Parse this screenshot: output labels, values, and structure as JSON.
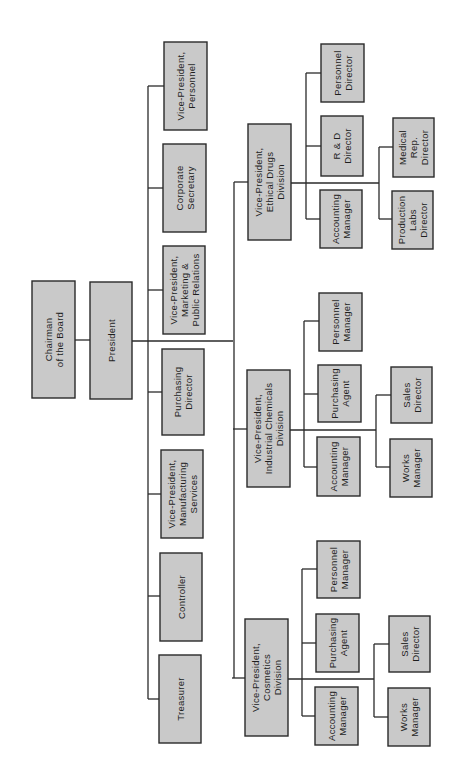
{
  "chart_data": {
    "type": "org-chart",
    "orientation": "rotated 90deg counter-clockwise",
    "root": {
      "id": "chairman",
      "label": [
        "Chairman",
        "of the Board"
      ],
      "children": [
        {
          "id": "president",
          "label": [
            "President"
          ],
          "children": [
            {
              "id": "vp-personnel",
              "label": [
                "Vice-President,",
                "Personnel"
              ]
            },
            {
              "id": "corporate-secretary",
              "label": [
                "Corporate",
                "Secretary"
              ]
            },
            {
              "id": "vp-marketing",
              "label": [
                "Vice-President,",
                "Marketing &",
                "Public Relations"
              ]
            },
            {
              "id": "purchasing-director",
              "label": [
                "Purchasing",
                "Director"
              ]
            },
            {
              "id": "vp-manufacturing",
              "label": [
                "Vice-President,",
                "Manufacturing",
                "Services"
              ]
            },
            {
              "id": "controller",
              "label": [
                "Controller"
              ]
            },
            {
              "id": "treasurer",
              "label": [
                "Treasurer"
              ]
            },
            {
              "id": "vp-ethical-drugs",
              "label": [
                "Vice-President,",
                "Ethical Drugs",
                "Division"
              ],
              "children": [
                {
                  "id": "ed-personnel-director",
                  "label": [
                    "Personnel",
                    "Director"
                  ]
                },
                {
                  "id": "ed-rd-director",
                  "label": [
                    "R & D",
                    "Director"
                  ]
                },
                {
                  "id": "ed-accounting-manager",
                  "label": [
                    "Accounting",
                    "Manager"
                  ]
                },
                {
                  "id": "ed-medical-rep-director",
                  "label": [
                    "Medical",
                    "Rep.",
                    "Director"
                  ]
                },
                {
                  "id": "ed-production-labs-director",
                  "label": [
                    "Production",
                    "Labs",
                    "Director"
                  ]
                }
              ]
            },
            {
              "id": "vp-industrial-chemicals",
              "label": [
                "Vice-President,",
                "Industrial Chemicals",
                "Division"
              ],
              "children": [
                {
                  "id": "ic-personnel-manager",
                  "label": [
                    "Personnel",
                    "Manager"
                  ]
                },
                {
                  "id": "ic-purchasing-agent",
                  "label": [
                    "Purchasing",
                    "Agent"
                  ]
                },
                {
                  "id": "ic-accounting-manager",
                  "label": [
                    "Accounting",
                    "Manager"
                  ]
                },
                {
                  "id": "ic-sales-director",
                  "label": [
                    "Sales",
                    "Director"
                  ]
                },
                {
                  "id": "ic-works-manager",
                  "label": [
                    "Works",
                    "Manager"
                  ]
                }
              ]
            },
            {
              "id": "vp-cosmetics",
              "label": [
                "Vice-President,",
                "Cosmetics",
                "Division"
              ],
              "children": [
                {
                  "id": "co-personnel-manager",
                  "label": [
                    "Personnel",
                    "Manager"
                  ]
                },
                {
                  "id": "co-purchasing-agent",
                  "label": [
                    "Purchasing",
                    "Agent"
                  ]
                },
                {
                  "id": "co-accounting-manager",
                  "label": [
                    "Accounting",
                    "Manager"
                  ]
                },
                {
                  "id": "co-sales-director",
                  "label": [
                    "Sales",
                    "Director"
                  ]
                },
                {
                  "id": "co-works-manager",
                  "label": [
                    "Works",
                    "Manager"
                  ]
                }
              ]
            }
          ]
        }
      ]
    }
  },
  "colors": {
    "box_fill": "#c9c9c9",
    "box_stroke": "#2a2a2a",
    "line": "#2a2a2a",
    "background": "#ffffff"
  },
  "boxes": [
    {
      "id": "chairman",
      "x": 32,
      "y": 281,
      "w": 43,
      "h": 117,
      "lines": [
        "Chairman",
        "of the Board"
      ]
    },
    {
      "id": "president",
      "x": 90,
      "y": 282,
      "w": 42,
      "h": 117,
      "lines": [
        "President"
      ]
    },
    {
      "id": "vp-personnel",
      "x": 164,
      "y": 42,
      "w": 43,
      "h": 88,
      "lines": [
        "Vice-President,",
        "Personnel"
      ]
    },
    {
      "id": "corporate-secretary",
      "x": 163,
      "y": 144,
      "w": 43,
      "h": 88,
      "lines": [
        "Corporate",
        "Secretary"
      ]
    },
    {
      "id": "vp-marketing",
      "x": 163,
      "y": 246,
      "w": 42,
      "h": 88,
      "lines": [
        "Vice-President,",
        "Marketing &",
        "Public Relations"
      ]
    },
    {
      "id": "purchasing-director",
      "x": 162,
      "y": 349,
      "w": 42,
      "h": 86,
      "lines": [
        "Purchasing",
        "Director"
      ]
    },
    {
      "id": "vp-manufacturing",
      "x": 161,
      "y": 450,
      "w": 42,
      "h": 88,
      "lines": [
        "Vice-President,",
        "Manufacturing",
        "Services"
      ]
    },
    {
      "id": "controller",
      "x": 160,
      "y": 553,
      "w": 42,
      "h": 88,
      "lines": [
        "Controller"
      ]
    },
    {
      "id": "treasurer",
      "x": 159,
      "y": 655,
      "w": 42,
      "h": 88,
      "lines": [
        "Treasurer"
      ]
    },
    {
      "id": "vp-ethical-drugs",
      "x": 248,
      "y": 124,
      "w": 43,
      "h": 116,
      "lines": [
        "Vice-President,",
        "Ethical Drugs",
        "Division"
      ]
    },
    {
      "id": "vp-industrial-chemicals",
      "x": 247,
      "y": 370,
      "w": 43,
      "h": 117,
      "lines": [
        "Vice-President,",
        "Industrial Chemicals",
        "Division"
      ]
    },
    {
      "id": "vp-cosmetics",
      "x": 245,
      "y": 619,
      "w": 43,
      "h": 117,
      "lines": [
        "Vice-President,",
        "Cosmetics",
        "Division"
      ]
    },
    {
      "id": "ed-personnel-director",
      "x": 321,
      "y": 44,
      "w": 43,
      "h": 58,
      "lines": [
        "Personnel",
        "Director"
      ]
    },
    {
      "id": "ed-rd-director",
      "x": 321,
      "y": 116,
      "w": 42,
      "h": 60,
      "lines": [
        "R & D",
        "Director"
      ]
    },
    {
      "id": "ed-accounting-manager",
      "x": 320,
      "y": 190,
      "w": 42,
      "h": 58,
      "lines": [
        "Accounting",
        "Manager"
      ]
    },
    {
      "id": "ed-medical-rep-director",
      "x": 393,
      "y": 118,
      "w": 41,
      "h": 59,
      "lines": [
        "Medical",
        "Rep.",
        "Director"
      ]
    },
    {
      "id": "ed-production-labs-director",
      "x": 392,
      "y": 191,
      "w": 41,
      "h": 58,
      "lines": [
        "Production",
        "Labs",
        "Director"
      ]
    },
    {
      "id": "ic-personnel-manager",
      "x": 319,
      "y": 293,
      "w": 43,
      "h": 58,
      "lines": [
        "Personnel",
        "Manager"
      ]
    },
    {
      "id": "ic-purchasing-agent",
      "x": 318,
      "y": 365,
      "w": 43,
      "h": 57,
      "lines": [
        "Purchasing",
        "Agent"
      ]
    },
    {
      "id": "ic-accounting-manager",
      "x": 317,
      "y": 437,
      "w": 43,
      "h": 59,
      "lines": [
        "Accounting",
        "Manager"
      ]
    },
    {
      "id": "ic-sales-director",
      "x": 391,
      "y": 367,
      "w": 41,
      "h": 56,
      "lines": [
        "Sales",
        "Director"
      ]
    },
    {
      "id": "ic-works-manager",
      "x": 390,
      "y": 439,
      "w": 42,
      "h": 58,
      "lines": [
        "Works",
        "Manager"
      ]
    },
    {
      "id": "co-personnel-manager",
      "x": 317,
      "y": 541,
      "w": 43,
      "h": 57,
      "lines": [
        "Personnel",
        "Manager"
      ]
    },
    {
      "id": "co-purchasing-agent",
      "x": 316,
      "y": 614,
      "w": 43,
      "h": 58,
      "lines": [
        "Purchasing",
        "Agent"
      ]
    },
    {
      "id": "co-accounting-manager",
      "x": 315,
      "y": 687,
      "w": 43,
      "h": 58,
      "lines": [
        "Accounting",
        "Manager"
      ]
    },
    {
      "id": "co-sales-director",
      "x": 389,
      "y": 616,
      "w": 41,
      "h": 56,
      "lines": [
        "Sales",
        "Director"
      ]
    },
    {
      "id": "co-works-manager",
      "x": 388,
      "y": 688,
      "w": 42,
      "h": 58,
      "lines": [
        "Works",
        "Manager"
      ]
    }
  ],
  "connectors": [
    {
      "from": "chairman",
      "to": "president",
      "path": "M75 340 H90"
    },
    {
      "from": "president",
      "to": "staff-and-divisions",
      "path": "M132 341 H233"
    },
    {
      "from": "staff-spine",
      "path": "M148 86 V699"
    },
    {
      "to": "vp-personnel",
      "path": "M148 86 H164"
    },
    {
      "to": "corporate-secretary",
      "path": "M148 188 H163"
    },
    {
      "to": "vp-marketing",
      "path": "M148 290 H163"
    },
    {
      "to": "purchasing-director",
      "path": "M148 392 H162"
    },
    {
      "to": "vp-manufacturing",
      "path": "M148 494 H161"
    },
    {
      "to": "controller",
      "path": "M148 596 H160"
    },
    {
      "to": "treasurer",
      "path": "M148 699 H159"
    },
    {
      "from": "division-spine",
      "path": "M234 182 V678"
    },
    {
      "to": "vp-ethical-drugs",
      "path": "M234 182 H248"
    },
    {
      "to": "vp-industrial-chemicals",
      "path": "M233 429 H247"
    },
    {
      "to": "vp-cosmetics",
      "path": "M232 678 H245"
    },
    {
      "from": "vp-ethical-drugs",
      "path": "M291 183 H379"
    },
    {
      "path": "M306 73 V219"
    },
    {
      "to": "ed-personnel-director",
      "path": "M306 73 H321"
    },
    {
      "to": "ed-rd-director",
      "path": "M306 146 H321"
    },
    {
      "to": "ed-accounting-manager",
      "path": "M306 219 H320"
    },
    {
      "path": "M379 147 V219"
    },
    {
      "to": "ed-medical-rep-director",
      "path": "M379 147 H393"
    },
    {
      "to": "ed-production-labs-director",
      "path": "M379 219 H392"
    },
    {
      "from": "vp-industrial-chemicals",
      "path": "M290 430 H376"
    },
    {
      "path": "M304 321 V467"
    },
    {
      "to": "ic-personnel-manager",
      "path": "M304 321 H319"
    },
    {
      "to": "ic-purchasing-agent",
      "path": "M304 394 H318"
    },
    {
      "to": "ic-accounting-manager",
      "path": "M304 467 H317"
    },
    {
      "path": "M376 395 V467"
    },
    {
      "to": "ic-sales-director",
      "path": "M376 395 H391"
    },
    {
      "to": "ic-works-manager",
      "path": "M376 467 H390"
    },
    {
      "from": "vp-cosmetics",
      "path": "M288 679 H374"
    },
    {
      "path": "M302 569 V716"
    },
    {
      "to": "co-personnel-manager",
      "path": "M302 569 H317"
    },
    {
      "to": "co-purchasing-agent",
      "path": "M302 643 H316"
    },
    {
      "to": "co-accounting-manager",
      "path": "M302 716 H315"
    },
    {
      "path": "M374 644 V717"
    },
    {
      "to": "co-sales-director",
      "path": "M374 644 H389"
    },
    {
      "to": "co-works-manager",
      "path": "M374 717 H388"
    }
  ]
}
